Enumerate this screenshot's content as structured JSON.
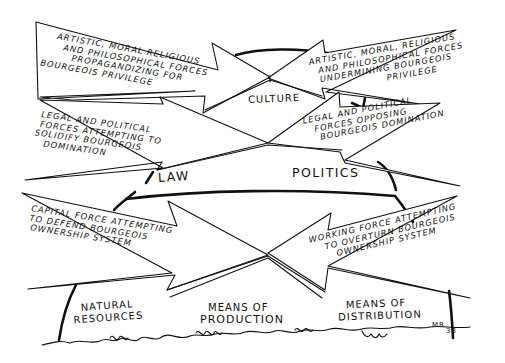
{
  "diagram": {
    "style": "hand-drawn ink illustration",
    "ink_color": "#111111",
    "background": "#ffffff",
    "superstructure": {
      "culture": {
        "label": "CULTURE",
        "left_arrow": {
          "lines": [
            "ARTISTIC, MORAL RELIGIOUS",
            "AND PHILOSOPHICAL FORCES",
            "PROPAGANDIZING FOR",
            "BOURGEOIS PRIVILEGE"
          ]
        },
        "right_arrow": {
          "lines": [
            "ARTISTIC, MORAL, RELIGIOUS",
            "AND PHILOSOPHICAL FORCES",
            "UNDERMINING BOURGEOIS",
            "PRIVILEGE"
          ]
        }
      },
      "law_politics": {
        "left_label": "LAW",
        "right_label": "POLITICS",
        "left_arrow": {
          "lines": [
            "LEGAL AND POLITICAL",
            "FORCES ATTEMPTING TO",
            "SOLIDIFY BOURGEOIS",
            "DOMINATION"
          ]
        },
        "right_arrow": {
          "lines": [
            "LEGAL AND POLITICAL",
            "FORCES OPPOSING",
            "BOURGEOIS DOMINATION"
          ]
        }
      }
    },
    "base": {
      "left_arrow": {
        "lines": [
          "CAPITAL FORCE ATTEMPTING",
          "TO DEFEND BOURGEOIS",
          "OWNERSHIP SYSTEM"
        ]
      },
      "right_arrow": {
        "lines": [
          "WORKING FORCE ATTEMPTING",
          "TO OVERTURN BOURGEOIS",
          "OWNERSHIP SYSTEM"
        ]
      },
      "ground_labels": [
        {
          "lines": [
            "NATURAL",
            "RESOURCES"
          ]
        },
        {
          "lines": [
            "MEANS OF",
            "PRODUCTION"
          ]
        },
        {
          "lines": [
            "MEANS OF",
            "DISTRIBUTION"
          ]
        }
      ]
    },
    "signature": "MR",
    "page_number": "33"
  }
}
